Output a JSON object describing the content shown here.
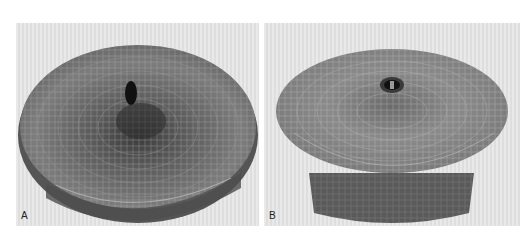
{
  "figure": {
    "panels": [
      {
        "label": "A",
        "subject": "woven mesh basket-like structure, viewed from above at an angle, with central dark hole"
      },
      {
        "label": "B",
        "subject": "woven mesh domed structure with central grommet, viewed from the side showing cylindrical base"
      }
    ]
  },
  "colors": {
    "background": "#ffffff",
    "panel_bg": "#e4e4e4",
    "mesh_dark": "#4a4a4a",
    "mesh_mid": "#7a7a7a",
    "mesh_light": "#a8a8a8"
  }
}
